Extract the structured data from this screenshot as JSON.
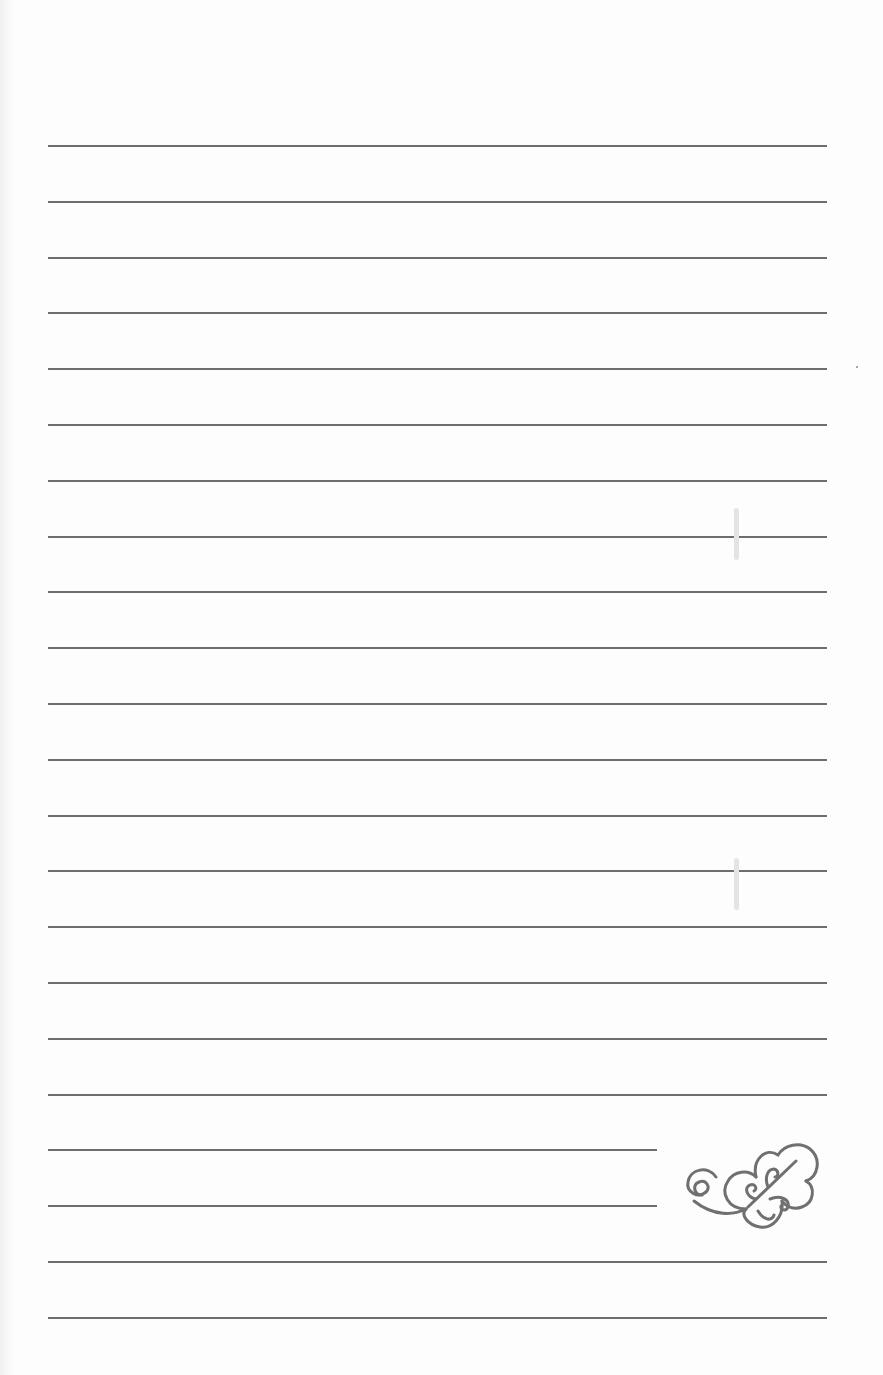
{
  "page": {
    "type": "lined-paper",
    "background": "#fdfdfd",
    "line_color": "#6e6e6e",
    "ornament_color": "#707070",
    "line_left": 48,
    "line_right_full": 827,
    "line_right_short": 657,
    "lines": [
      {
        "y": 145,
        "short": false
      },
      {
        "y": 201,
        "short": false
      },
      {
        "y": 257,
        "short": false
      },
      {
        "y": 312,
        "short": false
      },
      {
        "y": 368,
        "short": false
      },
      {
        "y": 424,
        "short": false
      },
      {
        "y": 480,
        "short": false
      },
      {
        "y": 536,
        "short": false
      },
      {
        "y": 591,
        "short": false
      },
      {
        "y": 647,
        "short": false
      },
      {
        "y": 703,
        "short": false
      },
      {
        "y": 759,
        "short": false
      },
      {
        "y": 815,
        "short": false
      },
      {
        "y": 870,
        "short": false
      },
      {
        "y": 926,
        "short": false
      },
      {
        "y": 982,
        "short": false
      },
      {
        "y": 1038,
        "short": false
      },
      {
        "y": 1094,
        "short": false
      },
      {
        "y": 1149,
        "short": true
      },
      {
        "y": 1205,
        "short": true
      },
      {
        "y": 1261,
        "short": false
      },
      {
        "y": 1317,
        "short": false
      }
    ],
    "ornament": {
      "name": "swirl-leaf-flourish"
    }
  }
}
